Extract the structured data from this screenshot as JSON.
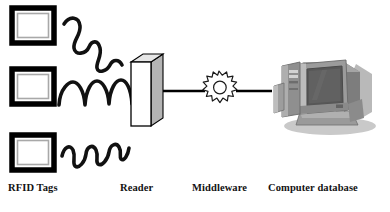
{
  "diagram": {
    "background_color": "#ffffff",
    "stroke_color": "#000000",
    "labels": {
      "tags": "RFID Tags",
      "reader": "Reader",
      "middleware": "Middleware",
      "database": "Computer database"
    },
    "nodes": [
      {
        "id": "rfid-tags",
        "name": "RFID Tags",
        "type": "tag-stack",
        "count": 3,
        "shape": "nested-rectangle",
        "colors": {
          "outer_border": "#000000",
          "inner_border": "#a8a8a8",
          "fill": "#ffffff"
        }
      },
      {
        "id": "reader",
        "name": "Reader",
        "type": "3d-box",
        "colors": {
          "front": "#ffffff",
          "side": "#b5b5b5",
          "top": "#e2e2e2",
          "outline": "#000000"
        }
      },
      {
        "id": "middleware",
        "name": "Middleware",
        "type": "gear",
        "teeth": 16,
        "colors": {
          "outline": "#1a1a1a",
          "fill": "#ffffff"
        }
      },
      {
        "id": "computer-database",
        "name": "Computer database",
        "type": "crt-computer-photo",
        "colors": {
          "body": "#8d8d8d",
          "screen": "#5b5b5b",
          "highlight": "#c3c3c3",
          "shadow": "#6a6a6a"
        }
      }
    ],
    "connections": [
      {
        "from": "rfid-tags",
        "to": "reader",
        "style": "radio-wave-squiggle",
        "count": 3
      },
      {
        "from": "reader",
        "to": "middleware",
        "style": "solid-line"
      },
      {
        "from": "middleware",
        "to": "computer-database",
        "style": "solid-line"
      }
    ]
  }
}
